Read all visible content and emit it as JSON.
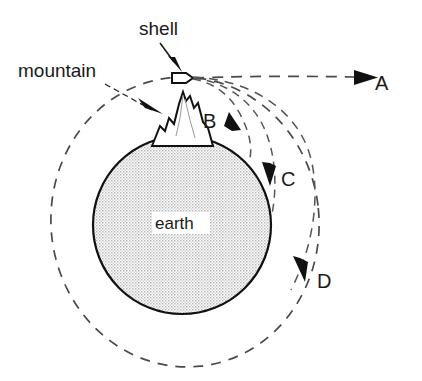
{
  "figure": {
    "background_color": "#ffffff",
    "ink_color": "#111111",
    "dash_color": "#4a4a4a",
    "earth_fill": "#e8e8e8"
  },
  "annotations": {
    "shell_label": "shell",
    "mountain_label": "mountain",
    "earth_label": "earth"
  },
  "trajectories": [
    {
      "id": "A",
      "label": "A",
      "kind": "straight-escape"
    },
    {
      "id": "B",
      "label": "B",
      "kind": "short-impact"
    },
    {
      "id": "C",
      "label": "C",
      "kind": "long-impact"
    },
    {
      "id": "D",
      "label": "D",
      "kind": "orbit"
    }
  ],
  "objects": {
    "shell": "projectile-shell",
    "mountain": "mountain-peak",
    "earth": "earth-sphere"
  }
}
